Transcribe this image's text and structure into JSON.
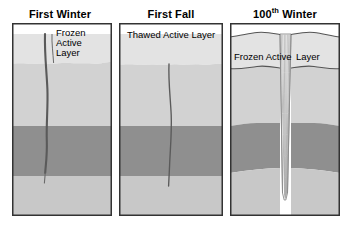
{
  "figure": {
    "name": "ice-wedge-formation-diagram",
    "panel_count": 3,
    "background_color": "#ffffff"
  },
  "colors": {
    "air_snow": "#ffffff",
    "active_layer": "#e3e3e3",
    "upper_permafrost": "#d2d2d2",
    "middle_permafrost": "#8f8f8f",
    "lower_permafrost": "#c8c8c8",
    "ice_wedge": "#ffffff",
    "outline": "#333333",
    "crack": "#555555",
    "striation": "#9a9a9a",
    "text": "#000000"
  },
  "panels": [
    {
      "id": "first-winter",
      "title": "First Winter",
      "label_lines": [
        "Frozen",
        "Active",
        "Layer"
      ],
      "label_single": "Frozen Active Layer",
      "crack": {
        "present": true,
        "starts_at": "surface",
        "ends_in": "lower_permafrost",
        "width_px": 2
      },
      "strata": [
        "air_snow",
        "active_layer",
        "upper_permafrost",
        "middle_permafrost",
        "lower_permafrost"
      ],
      "ice_wedge": false
    },
    {
      "id": "first-fall",
      "title": "First Fall",
      "label_lines": [
        "Thawed Active Layer"
      ],
      "label_single": "Thawed Active Layer",
      "crack": {
        "present": true,
        "starts_at": "active-layer-base",
        "ends_in": "lower_permafrost",
        "width_px": 1
      },
      "strata": [
        "air_snow",
        "active_layer",
        "upper_permafrost",
        "middle_permafrost",
        "lower_permafrost"
      ],
      "ice_wedge": false
    },
    {
      "id": "hundredth-winter",
      "title_prefix": "100",
      "title_superscript": "th",
      "title_suffix": " Winter",
      "title": "100th Winter",
      "label_left": "Frozen Active",
      "label_right": "Layer",
      "label_single": "Frozen Active Layer",
      "crack": {
        "present": false
      },
      "strata": [
        "air_snow",
        "active_layer",
        "upper_permafrost",
        "middle_permafrost",
        "lower_permafrost"
      ],
      "ice_wedge": true,
      "ice_wedge_striation_count": 7,
      "strata_deformation": "upturned-shoulders"
    }
  ]
}
